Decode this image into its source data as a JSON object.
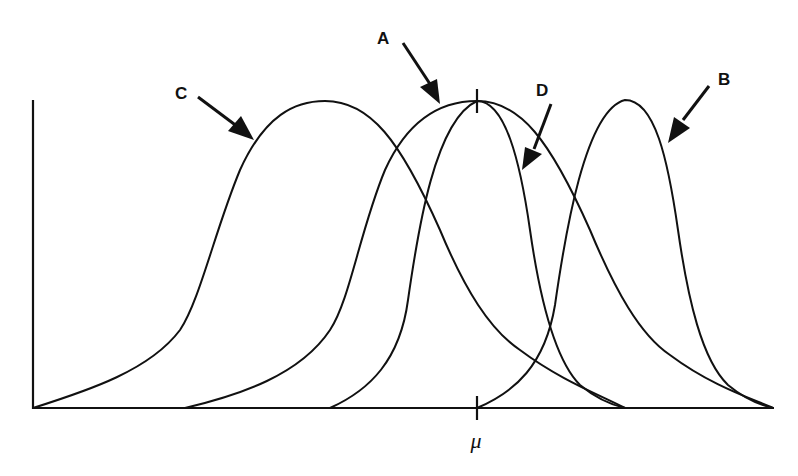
{
  "figure": {
    "x_axis_label": "μ",
    "colors": {
      "stroke": "#111111",
      "background": "#ffffff"
    }
  },
  "curves": [
    {
      "id": "A",
      "label": "A",
      "start_x": 185,
      "peak_x": 477,
      "end_x": 773,
      "note": "centered on μ, wide"
    },
    {
      "id": "B",
      "label": "B",
      "start_x": 477,
      "peak_x": 625,
      "end_x": 773,
      "note": "shifted right, narrow"
    },
    {
      "id": "C",
      "label": "C",
      "start_x": 33,
      "peak_x": 325,
      "end_x": 625,
      "note": "shifted left, wide"
    },
    {
      "id": "D",
      "label": "D",
      "start_x": 330,
      "peak_x": 477,
      "end_x": 625,
      "note": "centered on μ, narrow"
    }
  ],
  "labels": {
    "A": "A",
    "B": "B",
    "C": "C",
    "D": "D",
    "mu": "μ"
  }
}
